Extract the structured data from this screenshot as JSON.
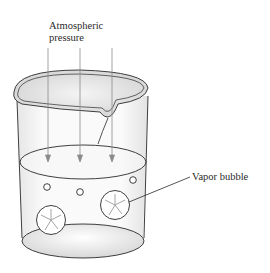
{
  "diagram": {
    "labels": {
      "pressure_line1": "Atmospheric",
      "pressure_line2": "pressure",
      "bubble": "Vapor bubble"
    },
    "elements": {
      "beaker": "glass beaker with pouring spout",
      "liquid": "liquid surface inside beaker",
      "pressure_arrows": 3,
      "small_bubbles": 4,
      "large_vapor_bubbles": 2
    },
    "colors": {
      "stroke": "#2a2a2a",
      "arrow": "#8a8a8a",
      "glass_shade": "#e4e4e4",
      "background": "#ffffff"
    }
  }
}
